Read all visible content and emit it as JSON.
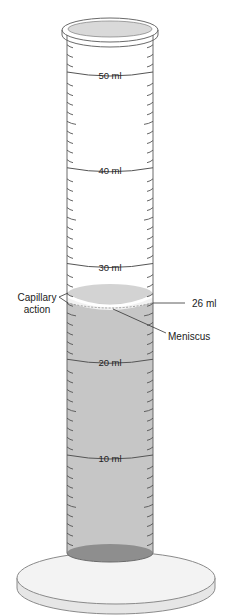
{
  "diagram": {
    "scale_labels": [
      {
        "text": "50 ml",
        "value": 50,
        "y": 75
      },
      {
        "text": "40 ml",
        "value": 40,
        "y": 170
      },
      {
        "text": "30 ml",
        "value": 30,
        "y": 267
      },
      {
        "text": "20 ml",
        "value": 20,
        "y": 362
      },
      {
        "text": "10 ml",
        "value": 10,
        "y": 458
      }
    ],
    "annotations": {
      "capillary_line1": "Capillary",
      "capillary_line2": "action",
      "reading": "26 ml",
      "meniscus": "Meniscus"
    },
    "liquid_level_ml": 26,
    "colors": {
      "liquid": "#c9c9c9",
      "liquid_bottom": "#8f8f8f",
      "glass_outline": "#6a6a6a",
      "meniscus_highlight": "#f4f4f4",
      "base": "#f2f2f2"
    }
  }
}
